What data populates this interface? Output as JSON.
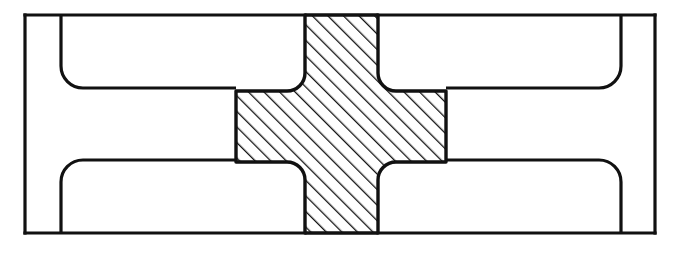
{
  "document": {
    "kind": "engineering-drawing",
    "view": "cross-section",
    "title": "Cruciform key in rectangular housing",
    "background_color": "#ffffff",
    "line_color": "#111111",
    "hatch_color": "#111111"
  },
  "canvas": {
    "width": 679,
    "height": 253
  },
  "geometry": {
    "outer_frame": {
      "name": "housing-outline",
      "x1": 25,
      "y1": 15,
      "x2": 655,
      "y2": 233,
      "stroke_width": 3.2
    },
    "left_recess": {
      "name": "left-recess",
      "wall_x": 61,
      "top_y": 15,
      "bottom_y": 233,
      "upper_inner_y": 88,
      "lower_inner_y": 160,
      "inner_edge_x": 236,
      "corner_radius": 22,
      "stroke_width": 3.2
    },
    "right_recess": {
      "name": "right-recess",
      "wall_x": 621,
      "top_y": 15,
      "bottom_y": 233,
      "upper_inner_y": 88,
      "lower_inner_y": 160,
      "inner_edge_x": 446,
      "corner_radius": 22,
      "stroke_width": 3.2
    },
    "cross": {
      "name": "cruciform-part",
      "vertical_arm": {
        "left_x": 305,
        "right_x": 378,
        "top_y": 15,
        "bottom_y": 233
      },
      "horizontal_arm": {
        "left_x": 236,
        "right_x": 446,
        "top_y": 91,
        "bottom_y": 162
      },
      "fillet_radius": 18,
      "stroke_width": 3.4,
      "hatch": {
        "angle_deg": 45,
        "direction": "up-right",
        "spacing": 11,
        "line_width": 2.6
      }
    }
  },
  "labels": {
    "none_visible": ""
  }
}
